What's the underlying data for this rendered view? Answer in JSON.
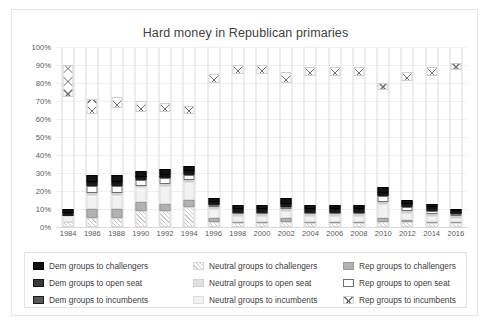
{
  "chart_data": {
    "type": "bar",
    "subtype": "stacked-percentage",
    "title": "Hard money in Republican primaries",
    "xlabel": "",
    "ylabel": "",
    "ylim": [
      0,
      100
    ],
    "ytick_labels": [
      "0%",
      "10%",
      "20%",
      "30%",
      "40%",
      "50%",
      "60%",
      "70%",
      "80%",
      "90%",
      "100%"
    ],
    "ytick_values": [
      0,
      10,
      20,
      30,
      40,
      50,
      60,
      70,
      80,
      90,
      100
    ],
    "grid": true,
    "legend_position": "bottom",
    "categories": [
      "1984",
      "1986",
      "1988",
      "1990",
      "1992",
      "1994",
      "1996",
      "1998",
      "2000",
      "2002",
      "2004",
      "2006",
      "2008",
      "2010",
      "2012",
      "2014",
      "2016"
    ],
    "series": [
      {
        "name": "Neutral groups to challengers",
        "key": "neutral-challengers",
        "pattern": "diagonal-hatch",
        "color": "#c9c9c9",
        "values": [
          3,
          5,
          5,
          9,
          9,
          11,
          3,
          2,
          2,
          3,
          2,
          2,
          2,
          3,
          3,
          2,
          2
        ]
      },
      {
        "name": "Rep groups to challengers",
        "key": "rep-challengers",
        "pattern": "solid",
        "color": "#b2b2b2",
        "values": [
          0,
          5,
          5,
          5,
          4,
          4,
          2,
          1,
          1,
          2,
          1,
          1,
          1,
          2,
          1,
          1,
          1
        ]
      },
      {
        "name": "Neutral groups to incumbents",
        "key": "neutral-incumbents",
        "pattern": "solid",
        "color": "#f2f2f2",
        "values": [
          3,
          8,
          8,
          8,
          10,
          10,
          5,
          3,
          3,
          4,
          3,
          3,
          3,
          8,
          4,
          3,
          2
        ]
      },
      {
        "name": "Neutral groups to open seat",
        "key": "neutral-open-seat",
        "pattern": "solid",
        "color": "#e2e2e2",
        "values": [
          0,
          1,
          1,
          1,
          1,
          1,
          1,
          1,
          1,
          1,
          1,
          1,
          1,
          1,
          1,
          1,
          1
        ]
      },
      {
        "name": "Rep groups to open seat",
        "key": "rep-open-seat",
        "pattern": "outline",
        "color": "#fdfdfd",
        "values": [
          0,
          4,
          4,
          3,
          3,
          3,
          1,
          1,
          1,
          1,
          1,
          1,
          1,
          3,
          2,
          2,
          1
        ]
      },
      {
        "name": "Dem groups to incumbents",
        "key": "dem-incumbents",
        "pattern": "solid",
        "color": "#585858",
        "values": [
          1,
          1,
          1,
          1,
          1,
          1,
          1,
          1,
          1,
          1,
          1,
          1,
          1,
          1,
          1,
          1,
          1
        ]
      },
      {
        "name": "Dem groups to open seat",
        "key": "dem-open-seat",
        "pattern": "solid",
        "color": "#3a3a3a",
        "values": [
          1,
          1,
          1,
          1,
          1,
          1,
          1,
          1,
          1,
          1,
          1,
          1,
          1,
          1,
          1,
          1,
          1
        ]
      },
      {
        "name": "Dem groups to challengers",
        "key": "dem-challengers",
        "pattern": "solid",
        "color": "#121212",
        "values": [
          2,
          4,
          4,
          3,
          3,
          3,
          2,
          2,
          2,
          3,
          2,
          2,
          2,
          3,
          2,
          2,
          1
        ]
      },
      {
        "name": "Rep groups to incumbents",
        "key": "rep-incumbents",
        "pattern": "cross-hatch",
        "color": "#6f6f6f",
        "gap_below_percent": [
          72,
          63,
          66,
          64,
          64,
          63,
          80,
          85,
          85,
          80,
          84,
          84,
          84,
          76,
          81,
          84,
          87
        ],
        "values": [
          18,
          8,
          6,
          6,
          5,
          4,
          5,
          5,
          5,
          6,
          5,
          5,
          5,
          4,
          5,
          5,
          4
        ]
      }
    ]
  },
  "legend": {
    "columns": [
      {
        "items": [
          {
            "label": "Dem groups to challengers",
            "swatch": "dem-challengers-swatch"
          },
          {
            "label": "Dem groups to open seat",
            "swatch": "dem-open-seat-swatch"
          },
          {
            "label": "Dem groups to incumbents",
            "swatch": "dem-incumbents-swatch"
          }
        ]
      },
      {
        "items": [
          {
            "label": "Neutral groups to challengers",
            "swatch": "neutral-challengers-swatch"
          },
          {
            "label": "Neutral groups to open seat",
            "swatch": "neutral-open-seat-swatch"
          },
          {
            "label": "Neutral groups to incumbents",
            "swatch": "neutral-incumbents-swatch"
          }
        ]
      },
      {
        "items": [
          {
            "label": "Rep groups to challengers",
            "swatch": "rep-challengers-swatch"
          },
          {
            "label": "Rep groups to open seat",
            "swatch": "rep-open-seat-swatch"
          },
          {
            "label": "Rep groups to incumbents",
            "swatch": "rep-incumbents-swatch"
          }
        ]
      }
    ]
  }
}
